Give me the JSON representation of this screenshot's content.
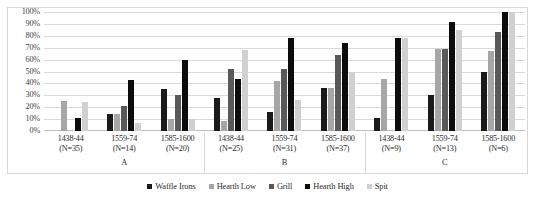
{
  "chart_data": {
    "type": "bar",
    "title": "",
    "subtitle": "",
    "xlabel": "",
    "ylabel": "",
    "ylim": [
      0,
      100
    ],
    "y_unit": "%",
    "grid": true,
    "legend_position": "bottom",
    "y_ticks": [
      "100%",
      "90%",
      "80%",
      "70%",
      "60%",
      "50%",
      "40%",
      "30%",
      "20%",
      "10%",
      "0%"
    ],
    "y_tick_values": [
      100,
      90,
      80,
      70,
      60,
      50,
      40,
      30,
      20,
      10,
      0
    ],
    "sections": [
      {
        "label": "A",
        "groups": [
          0,
          1,
          2
        ]
      },
      {
        "label": "B",
        "groups": [
          3,
          4,
          5
        ]
      },
      {
        "label": "C",
        "groups": [
          6,
          7,
          8
        ]
      }
    ],
    "categories": [
      {
        "period": "1438-44",
        "n": "(N=35)"
      },
      {
        "period": "1559-74",
        "n": "(N=14)"
      },
      {
        "period": "1585-1600",
        "n": "(N=20)"
      },
      {
        "period": "1438-44",
        "n": "(N=25)"
      },
      {
        "period": "1559-74",
        "n": "(N=31)"
      },
      {
        "period": "1585-1600",
        "n": "(N=37)"
      },
      {
        "period": "1438-44",
        "n": "(N=9)"
      },
      {
        "period": "1559-74",
        "n": "(N=13)"
      },
      {
        "period": "1585-1600",
        "n": "(N=6)"
      }
    ],
    "series": [
      {
        "name": "Waffle Irons",
        "color": "#1a1a1a",
        "values": [
          0,
          14,
          35,
          28,
          16,
          36,
          11,
          30,
          50
        ]
      },
      {
        "name": "Hearth Low",
        "color": "#a6a6a6",
        "values": [
          25,
          14,
          10,
          8,
          42,
          36,
          44,
          69,
          67
        ]
      },
      {
        "name": "Grill",
        "color": "#595959",
        "values": [
          0,
          21,
          30,
          52,
          52,
          64,
          0,
          69,
          83
        ]
      },
      {
        "name": "Hearth High",
        "color": "#0d0d0d",
        "values": [
          11,
          43,
          60,
          44,
          78,
          74,
          78,
          92,
          100
        ]
      },
      {
        "name": "Spit",
        "color": "#d0d0d0",
        "values": [
          24,
          7,
          10,
          68,
          26,
          50,
          78,
          85,
          100
        ]
      }
    ]
  }
}
